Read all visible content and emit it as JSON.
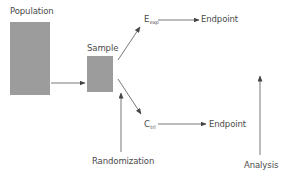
{
  "diagram": {
    "title": "",
    "nodes": {
      "population": {
        "label": "Population"
      },
      "sample": {
        "label": "Sample"
      },
      "experimental": {
        "label": "E",
        "subscript": "exp"
      },
      "control": {
        "label": "C",
        "subscript": "trl"
      },
      "endpoint_experimental": {
        "label": "Endpoint"
      },
      "endpoint_control": {
        "label": "Endpoint"
      },
      "randomization": {
        "label": "Randomization"
      },
      "analysis": {
        "label": "Analysis"
      }
    },
    "edges": [
      {
        "from": "population",
        "to": "sample"
      },
      {
        "from": "sample",
        "to": "experimental"
      },
      {
        "from": "sample",
        "to": "control"
      },
      {
        "from": "randomization",
        "to": "sample"
      },
      {
        "from": "experimental",
        "to": "endpoint_experimental"
      },
      {
        "from": "control",
        "to": "endpoint_control"
      },
      {
        "from": "analysis",
        "to": "endpoints",
        "direction": "up"
      }
    ],
    "colors": {
      "box_fill": "#9c9c9c",
      "line": "#555555",
      "text": "#4a4a4a"
    }
  }
}
